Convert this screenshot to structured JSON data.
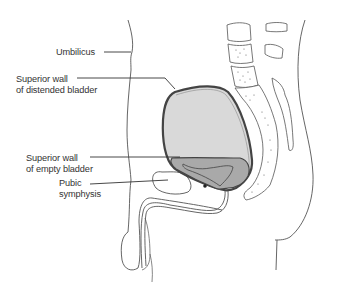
{
  "diagram": {
    "type": "anatomical-sagittal-section",
    "labels": [
      {
        "id": "umbilicus",
        "lines": [
          "Umbilicus"
        ]
      },
      {
        "id": "superior-wall-distended",
        "lines": [
          "Superior wall",
          "of distended bladder"
        ]
      },
      {
        "id": "superior-wall-empty",
        "lines": [
          "Superior wall",
          "of empty bladder"
        ]
      },
      {
        "id": "pubic-symphysis",
        "lines": [
          "Pubic",
          "symphysis"
        ]
      }
    ],
    "colors": {
      "outline": "#444444",
      "distended_fill": "#d9d9d9",
      "empty_fill": "#a9a9a9",
      "background": "#ffffff",
      "text": "#333333"
    }
  }
}
